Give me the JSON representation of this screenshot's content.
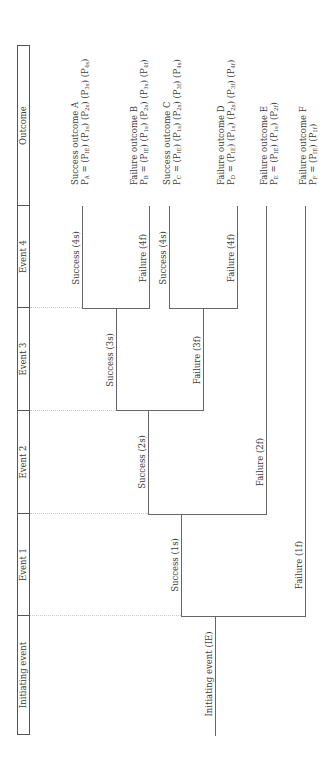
{
  "header": {
    "columns": [
      {
        "id": "initiating",
        "label": "Initiating event"
      },
      {
        "id": "event1",
        "label": "Event 1"
      },
      {
        "id": "event2",
        "label": "Event 2"
      },
      {
        "id": "event3",
        "label": "Event 3"
      },
      {
        "id": "event4",
        "label": "Event 4"
      },
      {
        "id": "outcome",
        "label": "Outcome"
      }
    ]
  },
  "tree": {
    "root_label": "Initiating event (IE)",
    "branches": {
      "s1": "Success (1s)",
      "f1": "Failure (1f)",
      "s2": "Success (2s)",
      "f2": "Failure (2f)",
      "s3": "Success (3s)",
      "f3": "Failure (3f)",
      "s4a": "Success (4s)",
      "f4a": "Failure (4f)",
      "s4b": "Success (4s)",
      "f4b": "Failure (4f)"
    }
  },
  "outcomes": [
    {
      "id": "A",
      "title": "Success outcome A",
      "symbol": "P",
      "sub": "A",
      "terms": [
        "IE",
        "1s",
        "2s",
        "3s",
        "4s"
      ]
    },
    {
      "id": "B",
      "title": "Failure outcome B",
      "symbol": "P",
      "sub": "B",
      "terms": [
        "IE",
        "1s",
        "2s",
        "3s",
        "4f"
      ]
    },
    {
      "id": "C",
      "title": "Success outcome C",
      "symbol": "P",
      "sub": "C",
      "terms": [
        "IE",
        "1s",
        "2s",
        "3f",
        "4s"
      ]
    },
    {
      "id": "D",
      "title": "Failure outcome D",
      "symbol": "P",
      "sub": "D",
      "terms": [
        "IE",
        "1s",
        "2s",
        "3f",
        "4f"
      ]
    },
    {
      "id": "E",
      "title": "Failure outcome E",
      "symbol": "P",
      "sub": "E",
      "terms": [
        "IE",
        "1s",
        "2f"
      ]
    },
    {
      "id": "F",
      "title": "Failure outcome F",
      "symbol": "P",
      "sub": "F",
      "terms": [
        "IE",
        "1f"
      ]
    }
  ],
  "colors": {
    "line": "#666666",
    "text": "#3a3a3a",
    "guide": "#c8c8c8"
  }
}
